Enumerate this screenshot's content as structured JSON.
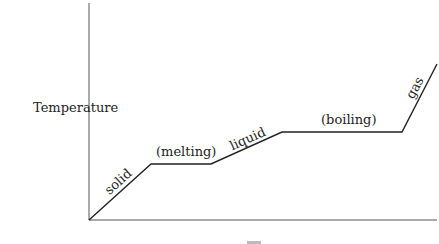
{
  "chart_data": {
    "type": "line",
    "title": "",
    "ylabel": "Temperature",
    "xlabel": "",
    "grid": false,
    "legend": null,
    "axes": {
      "origin": [
        89,
        220
      ],
      "y_axis_top": [
        89,
        3
      ],
      "x_axis_end": [
        437,
        220
      ]
    },
    "points": [
      [
        89,
        220
      ],
      [
        151,
        164
      ],
      [
        211,
        164
      ],
      [
        282,
        132
      ],
      [
        402,
        132
      ],
      [
        437,
        64
      ]
    ],
    "segments": [
      {
        "label": "solid",
        "kind": "heating"
      },
      {
        "label": "(melting)",
        "kind": "plateau"
      },
      {
        "label": "liquid",
        "kind": "heating"
      },
      {
        "label": "(boiling)",
        "kind": "plateau"
      },
      {
        "label": "gas",
        "kind": "heating"
      }
    ],
    "annotations": [
      {
        "text": "solid",
        "x": 115,
        "y": 187,
        "rotate": -42
      },
      {
        "text": "(melting)",
        "x": 181,
        "y": 156,
        "rotate": 0
      },
      {
        "text": "liquid",
        "x": 248,
        "y": 143,
        "rotate": -24
      },
      {
        "text": "(boiling)",
        "x": 345,
        "y": 124,
        "rotate": 0
      },
      {
        "text": "gas",
        "x": 417,
        "y": 92,
        "rotate": -62
      }
    ]
  },
  "labels": {
    "y_axis": "Temperature",
    "solid": "solid",
    "melting": "(melting)",
    "liquid": "liquid",
    "boiling": "(boiling)",
    "gas": "gas"
  },
  "colors": {
    "axis": "#555555",
    "curve": "#222222",
    "text": "#222222"
  }
}
